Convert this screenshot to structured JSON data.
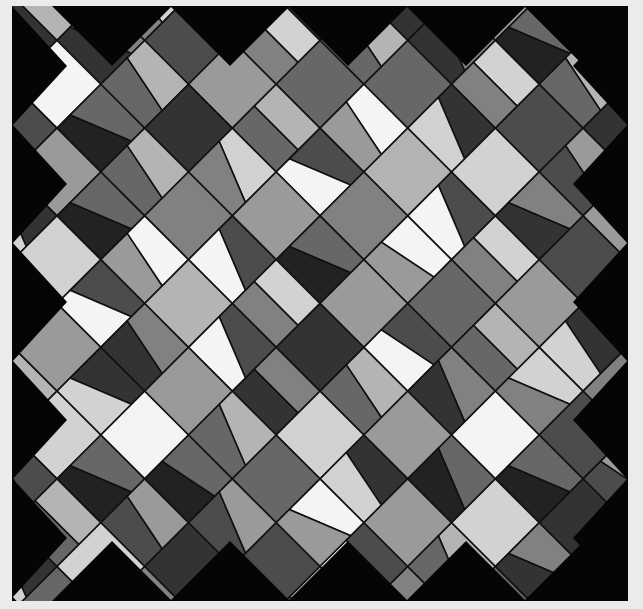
{
  "artwork": {
    "description": "Abstract grayscale stained-glass style quilt mosaic of tilted squares on black",
    "background": "#050505",
    "margin": "#ecebea",
    "outline": "#111111",
    "palette": [
      "#f4f4f4",
      "#d2d2d2",
      "#b4b4b4",
      "#9a9a9a",
      "#818181",
      "#676767",
      "#4c4c4c",
      "#333333",
      "#222222"
    ],
    "grid": {
      "cell": 62,
      "rotation": 45,
      "cols": 14,
      "rows": 14
    },
    "tones": [
      [
        2,
        0,
        5,
        1,
        3,
        4,
        0,
        6,
        2,
        5,
        1,
        3,
        7,
        2
      ],
      [
        4,
        2,
        1,
        6,
        0,
        3,
        5,
        2,
        7,
        1,
        4,
        0,
        3,
        6
      ],
      [
        1,
        5,
        3,
        2,
        7,
        4,
        1,
        6,
        3,
        0,
        5,
        2,
        6,
        1
      ],
      [
        6,
        3,
        0,
        4,
        2,
        5,
        7,
        1,
        4,
        6,
        2,
        3,
        0,
        5
      ],
      [
        3,
        7,
        4,
        1,
        5,
        0,
        2,
        6,
        1,
        3,
        7,
        4,
        2,
        4
      ],
      [
        5,
        1,
        6,
        3,
        2,
        6,
        4,
        0,
        5,
        2,
        1,
        6,
        3,
        1
      ],
      [
        2,
        4,
        2,
        7,
        1,
        3,
        5,
        3,
        6,
        4,
        0,
        5,
        7,
        2
      ],
      [
        7,
        0,
        5,
        2,
        4,
        6,
        1,
        7,
        2,
        3,
        5,
        1,
        4,
        6
      ],
      [
        1,
        6,
        3,
        5,
        0,
        2,
        6,
        4,
        1,
        7,
        3,
        2,
        5,
        3
      ],
      [
        4,
        2,
        7,
        1,
        6,
        4,
        3,
        2,
        5,
        0,
        6,
        4,
        1,
        7
      ],
      [
        3,
        5,
        1,
        4,
        3,
        7,
        0,
        5,
        3,
        6,
        2,
        7,
        3,
        2
      ],
      [
        6,
        1,
        4,
        6,
        2,
        1,
        5,
        3,
        7,
        2,
        4,
        0,
        6,
        4
      ],
      [
        2,
        4,
        0,
        3,
        5,
        6,
        2,
        1,
        4,
        5,
        1,
        3,
        2,
        5
      ],
      [
        5,
        3,
        6,
        1,
        4,
        2,
        7,
        5,
        0,
        3,
        6,
        4,
        1,
        3
      ]
    ],
    "splits": [
      [
        1,
        0,
        1,
        1,
        0,
        1,
        0,
        1,
        1,
        0,
        1,
        0,
        1,
        1
      ],
      [
        0,
        1,
        1,
        0,
        1,
        0,
        1,
        1,
        0,
        1,
        0,
        1,
        1,
        0
      ],
      [
        1,
        1,
        0,
        1,
        0,
        1,
        1,
        0,
        1,
        1,
        0,
        1,
        0,
        1
      ],
      [
        0,
        1,
        0,
        1,
        1,
        0,
        1,
        0,
        1,
        0,
        1,
        1,
        0,
        1
      ],
      [
        1,
        0,
        1,
        1,
        0,
        1,
        0,
        1,
        1,
        0,
        1,
        0,
        1,
        0
      ],
      [
        1,
        1,
        0,
        0,
        1,
        1,
        0,
        1,
        0,
        1,
        1,
        0,
        1,
        1
      ],
      [
        0,
        1,
        1,
        0,
        1,
        0,
        1,
        0,
        1,
        1,
        0,
        1,
        0,
        1
      ],
      [
        1,
        0,
        1,
        1,
        0,
        1,
        1,
        0,
        1,
        0,
        1,
        0,
        1,
        0
      ],
      [
        0,
        1,
        0,
        1,
        1,
        0,
        1,
        1,
        0,
        1,
        0,
        1,
        1,
        0
      ],
      [
        1,
        0,
        1,
        0,
        1,
        1,
        0,
        1,
        0,
        1,
        1,
        0,
        1,
        1
      ],
      [
        1,
        1,
        0,
        1,
        0,
        1,
        0,
        1,
        1,
        0,
        1,
        1,
        0,
        1
      ],
      [
        0,
        1,
        1,
        0,
        1,
        0,
        1,
        1,
        0,
        1,
        0,
        1,
        1,
        0
      ],
      [
        1,
        0,
        1,
        1,
        0,
        1,
        1,
        0,
        1,
        1,
        0,
        1,
        0,
        1
      ],
      [
        0,
        1,
        0,
        1,
        1,
        0,
        1,
        0,
        1,
        0,
        1,
        0,
        1,
        1
      ]
    ]
  }
}
